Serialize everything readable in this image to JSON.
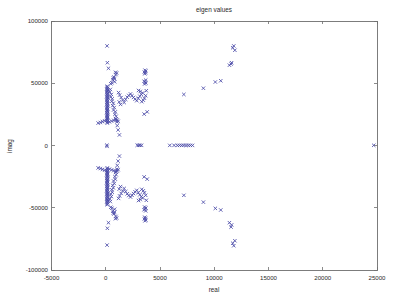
{
  "figure": {
    "title": "eigen values",
    "background_color": "#ffffff",
    "frame_color": "#6e6e6e",
    "text_color": "#2b2b2b"
  },
  "chart_data": {
    "type": "scatter",
    "title": "eigen values",
    "xlabel": "real",
    "ylabel": "imag",
    "xlim": [
      -5000,
      25000
    ],
    "ylim": [
      -100000,
      100000
    ],
    "xticks": [
      -5000,
      0,
      5000,
      10000,
      15000,
      20000,
      25000
    ],
    "xtick_labels": [
      "-5000",
      "0",
      "5000",
      "10000",
      "15000",
      "20000",
      "25000"
    ],
    "yticks": [
      -100000,
      -50000,
      0,
      50000,
      100000
    ],
    "ytick_labels": [
      "-100000",
      "-50000",
      "0",
      "50000",
      "100000"
    ],
    "grid": false,
    "legend": null,
    "marker": "x",
    "marker_color": "#4a4aa8",
    "marker_size": 3.4,
    "series": [
      {
        "name": "eigenvalues",
        "points": [
          [
            120,
            80000
          ],
          [
            120,
            -80000
          ],
          [
            150,
            66500
          ],
          [
            150,
            -66500
          ],
          [
            250,
            62000
          ],
          [
            250,
            -62000
          ],
          [
            900,
            58800
          ],
          [
            900,
            -58800
          ],
          [
            1000,
            58200
          ],
          [
            1000,
            -58200
          ],
          [
            940,
            57000
          ],
          [
            940,
            -57000
          ],
          [
            760,
            55000
          ],
          [
            760,
            -55000
          ],
          [
            700,
            54200
          ],
          [
            700,
            -54200
          ],
          [
            820,
            53600
          ],
          [
            820,
            -53600
          ],
          [
            650,
            52800
          ],
          [
            650,
            -52800
          ],
          [
            3620,
            60500
          ],
          [
            3620,
            -60500
          ],
          [
            3700,
            59800
          ],
          [
            3700,
            -59800
          ],
          [
            3560,
            59000
          ],
          [
            3560,
            -59000
          ],
          [
            3660,
            58400
          ],
          [
            3660,
            -58400
          ],
          [
            3600,
            57600
          ],
          [
            3600,
            -57600
          ],
          [
            3680,
            52500
          ],
          [
            3680,
            -52500
          ],
          [
            3540,
            51600
          ],
          [
            3540,
            -51600
          ],
          [
            3620,
            50800
          ],
          [
            3620,
            -50800
          ],
          [
            3700,
            50200
          ],
          [
            3700,
            -50200
          ],
          [
            3580,
            49400
          ],
          [
            3580,
            -49400
          ],
          [
            820,
            51200
          ],
          [
            820,
            -51200
          ],
          [
            560,
            50400
          ],
          [
            560,
            -50400
          ],
          [
            460,
            49600
          ],
          [
            460,
            -49600
          ],
          [
            140,
            47600
          ],
          [
            140,
            -47600
          ],
          [
            120,
            46800
          ],
          [
            120,
            -46800
          ],
          [
            160,
            46000
          ],
          [
            160,
            -46000
          ],
          [
            100,
            45300
          ],
          [
            100,
            -45300
          ],
          [
            180,
            44600
          ],
          [
            180,
            -44600
          ],
          [
            130,
            43900
          ],
          [
            130,
            -43900
          ],
          [
            150,
            43200
          ],
          [
            150,
            -43200
          ],
          [
            110,
            42500
          ],
          [
            110,
            -42500
          ],
          [
            170,
            41800
          ],
          [
            170,
            -41800
          ],
          [
            120,
            41100
          ],
          [
            120,
            -41100
          ],
          [
            140,
            40400
          ],
          [
            140,
            -40400
          ],
          [
            160,
            39700
          ],
          [
            160,
            -39700
          ],
          [
            100,
            39000
          ],
          [
            100,
            -39000
          ],
          [
            180,
            38300
          ],
          [
            180,
            -38300
          ],
          [
            130,
            37600
          ],
          [
            130,
            -37600
          ],
          [
            150,
            36900
          ],
          [
            150,
            -36900
          ],
          [
            110,
            36200
          ],
          [
            110,
            -36200
          ],
          [
            170,
            35500
          ],
          [
            170,
            -35500
          ],
          [
            120,
            34800
          ],
          [
            120,
            -34800
          ],
          [
            140,
            34100
          ],
          [
            140,
            -34100
          ],
          [
            160,
            33400
          ],
          [
            160,
            -33400
          ],
          [
            100,
            32700
          ],
          [
            100,
            -32700
          ],
          [
            180,
            32000
          ],
          [
            180,
            -32000
          ],
          [
            130,
            31300
          ],
          [
            130,
            -31300
          ],
          [
            150,
            30600
          ],
          [
            150,
            -30600
          ],
          [
            110,
            29900
          ],
          [
            110,
            -29900
          ],
          [
            170,
            29200
          ],
          [
            170,
            -29200
          ],
          [
            120,
            28500
          ],
          [
            120,
            -28500
          ],
          [
            140,
            27800
          ],
          [
            140,
            -27800
          ],
          [
            160,
            27100
          ],
          [
            160,
            -27100
          ],
          [
            100,
            26400
          ],
          [
            100,
            -26400
          ],
          [
            180,
            25700
          ],
          [
            180,
            -25700
          ],
          [
            130,
            25000
          ],
          [
            130,
            -25000
          ],
          [
            150,
            24300
          ],
          [
            150,
            -24300
          ],
          [
            110,
            23600
          ],
          [
            110,
            -23600
          ],
          [
            170,
            22900
          ],
          [
            170,
            -22900
          ],
          [
            120,
            22200
          ],
          [
            120,
            -22200
          ],
          [
            140,
            21500
          ],
          [
            140,
            -21500
          ],
          [
            160,
            20800
          ],
          [
            160,
            -20800
          ],
          [
            100,
            20100
          ],
          [
            100,
            -20100
          ],
          [
            180,
            19400
          ],
          [
            180,
            -19400
          ],
          [
            130,
            18700
          ],
          [
            130,
            -18700
          ],
          [
            150,
            18000
          ],
          [
            150,
            -18000
          ],
          [
            420,
            45000
          ],
          [
            420,
            -45000
          ],
          [
            380,
            43000
          ],
          [
            380,
            -43000
          ],
          [
            520,
            41000
          ],
          [
            520,
            -41000
          ],
          [
            470,
            39000
          ],
          [
            470,
            -39000
          ],
          [
            600,
            37500
          ],
          [
            600,
            -37500
          ],
          [
            560,
            35500
          ],
          [
            560,
            -35500
          ],
          [
            700,
            34000
          ],
          [
            700,
            -34000
          ],
          [
            640,
            32000
          ],
          [
            640,
            -32000
          ],
          [
            780,
            30500
          ],
          [
            780,
            -30500
          ],
          [
            720,
            28500
          ],
          [
            720,
            -28500
          ],
          [
            880,
            27000
          ],
          [
            880,
            -27000
          ],
          [
            840,
            25000
          ],
          [
            840,
            -25000
          ],
          [
            960,
            23500
          ],
          [
            960,
            -23500
          ],
          [
            920,
            21500
          ],
          [
            920,
            -21500
          ],
          [
            1060,
            20500
          ],
          [
            1060,
            -20500
          ],
          [
            1020,
            19000
          ],
          [
            1020,
            -19000
          ],
          [
            1180,
            42500
          ],
          [
            1180,
            -42500
          ],
          [
            1280,
            40500
          ],
          [
            1280,
            -40500
          ],
          [
            1420,
            38500
          ],
          [
            1420,
            -38500
          ],
          [
            1560,
            36500
          ],
          [
            1560,
            -36500
          ],
          [
            1700,
            34500
          ],
          [
            1700,
            -34500
          ],
          [
            1360,
            33000
          ],
          [
            1360,
            -33000
          ],
          [
            1240,
            35000
          ],
          [
            1240,
            -35000
          ],
          [
            1840,
            37000
          ],
          [
            1840,
            -37000
          ],
          [
            1980,
            38800
          ],
          [
            1980,
            -38800
          ],
          [
            2120,
            40200
          ],
          [
            2120,
            -40200
          ],
          [
            2280,
            41400
          ],
          [
            2280,
            -41400
          ],
          [
            2420,
            40000
          ],
          [
            2420,
            -40000
          ],
          [
            2560,
            38600
          ],
          [
            2560,
            -38600
          ],
          [
            2700,
            37200
          ],
          [
            2700,
            -37200
          ],
          [
            2860,
            36000
          ],
          [
            2860,
            -36000
          ],
          [
            3000,
            38000
          ],
          [
            3000,
            -38000
          ],
          [
            3140,
            39600
          ],
          [
            3140,
            -39600
          ],
          [
            3280,
            41000
          ],
          [
            3280,
            -41000
          ],
          [
            3400,
            42200
          ],
          [
            3400,
            -42200
          ],
          [
            3180,
            43400
          ],
          [
            3180,
            -43400
          ],
          [
            3020,
            44200
          ],
          [
            3020,
            -44200
          ],
          [
            3320,
            35200
          ],
          [
            3320,
            -35200
          ],
          [
            3460,
            36400
          ],
          [
            3460,
            -36400
          ],
          [
            3560,
            38000
          ],
          [
            3560,
            -38000
          ],
          [
            3680,
            40000
          ],
          [
            3680,
            -40000
          ],
          [
            3740,
            44000
          ],
          [
            3740,
            -44000
          ],
          [
            3820,
            27000
          ],
          [
            3820,
            -27000
          ],
          [
            3540,
            25200
          ],
          [
            3540,
            -25200
          ],
          [
            1260,
            8500
          ],
          [
            1260,
            -8500
          ],
          [
            1140,
            12500
          ],
          [
            1140,
            -12500
          ],
          [
            1060,
            16000
          ],
          [
            1060,
            -16000
          ],
          [
            -500,
            18500
          ],
          [
            -500,
            -18500
          ],
          [
            -700,
            18000
          ],
          [
            -700,
            -18000
          ],
          [
            -300,
            19200
          ],
          [
            -300,
            -19200
          ],
          [
            -100,
            19800
          ],
          [
            -100,
            -19800
          ],
          [
            340,
            19000
          ],
          [
            340,
            -19000
          ],
          [
            540,
            19600
          ],
          [
            540,
            -19600
          ],
          [
            740,
            20200
          ],
          [
            740,
            -20200
          ],
          [
            920,
            20800
          ],
          [
            920,
            -20800
          ],
          [
            1140,
            19400
          ],
          [
            1140,
            -19400
          ],
          [
            100,
            300
          ],
          [
            120,
            -700
          ],
          [
            2900,
            200
          ],
          [
            3050,
            150
          ],
          [
            3150,
            180
          ],
          [
            3300,
            120
          ],
          [
            5900,
            100
          ],
          [
            6300,
            120
          ],
          [
            6600,
            80
          ],
          [
            6800,
            140
          ],
          [
            7000,
            100
          ],
          [
            7200,
            160
          ],
          [
            7400,
            90
          ],
          [
            7600,
            130
          ],
          [
            7800,
            110
          ],
          [
            8000,
            70
          ],
          [
            7200,
            41000
          ],
          [
            7200,
            -40000
          ],
          [
            9000,
            46000
          ],
          [
            9000,
            -45500
          ],
          [
            10100,
            51000
          ],
          [
            10100,
            -50500
          ],
          [
            10600,
            52000
          ],
          [
            10600,
            -51800
          ],
          [
            11400,
            64500
          ],
          [
            11400,
            -62000
          ],
          [
            11600,
            66500
          ],
          [
            11600,
            -63800
          ],
          [
            11700,
            78500
          ],
          [
            11700,
            -78500
          ],
          [
            11800,
            80000
          ],
          [
            11800,
            -80500
          ],
          [
            11900,
            76500
          ],
          [
            11900,
            -76500
          ],
          [
            11550,
            65500
          ],
          [
            11550,
            -65500
          ],
          [
            24700,
            150
          ]
        ]
      }
    ]
  },
  "axes": {
    "x_axis_label": "real",
    "y_axis_label": "imag"
  }
}
